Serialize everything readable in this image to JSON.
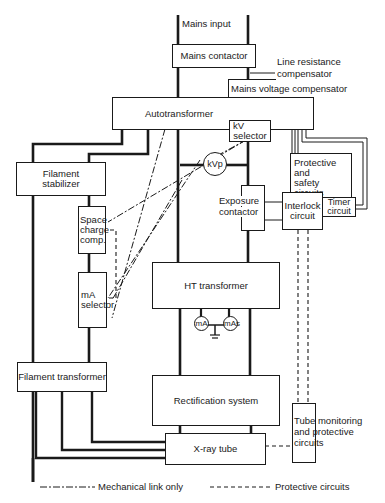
{
  "diagram": {
    "mains_input": "Mains input",
    "mains_contactor": "Mains contactor",
    "line_resistance_1": "Line resistance",
    "line_resistance_2": "compensator",
    "mains_voltage_comp": "Mains voltage compensator",
    "autotransformer": "Autotransformer",
    "kv_selector_1": "kV",
    "kv_selector_2": "selector",
    "filament_stabilizer_1": "Filament",
    "filament_stabilizer_2": "stabilizer",
    "kvp": "kVp",
    "protective_1": "Protective",
    "protective_2": "and",
    "protective_3": "safety circuits",
    "exposure_1": "Exposure",
    "exposure_2": "contactor",
    "interlock_1": "Interlock",
    "interlock_2": "circuit",
    "timer_1": "Timer",
    "timer_2": "circuit",
    "space_1": "Space",
    "space_2": "charge",
    "space_3": "comp.",
    "ma_selector_1": "mA",
    "ma_selector_2": "selector",
    "ht_transformer": "HT transformer",
    "ma_meter": "mA",
    "mas_meter": "mAs",
    "filament_transformer": "Filament transformer",
    "rectification": "Rectification system",
    "tube_monitoring_1": "Tube monitoring",
    "tube_monitoring_2": "and protective",
    "tube_monitoring_3": "circuits",
    "xray_tube": "X-ray tube"
  },
  "legend": {
    "mechanical": "Mechanical link only",
    "protective": "Protective circuits"
  }
}
